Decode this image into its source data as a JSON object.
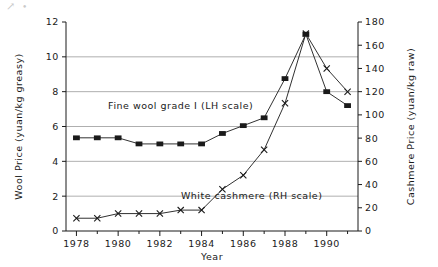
{
  "figure": {
    "background": "#ffffff",
    "ink_color": "#1a1a1a",
    "grid_color": "#9a9a9a",
    "scan_artifact": "↗"
  },
  "chart_data": {
    "type": "line",
    "title": "",
    "subtitle": "",
    "xlabel": "Year",
    "ylabel": "Wool Price (yuan/kg greasy)",
    "y2label": "Cashmere Price (yuan/kg raw)",
    "grid": true,
    "legend_position": "inline-annotation",
    "x": [
      1978,
      1979,
      1980,
      1981,
      1982,
      1983,
      1984,
      1985,
      1986,
      1987,
      1988,
      1989,
      1990,
      1991
    ],
    "xlim": [
      1977.5,
      1991.5
    ],
    "xticks": [
      1978,
      1980,
      1982,
      1984,
      1986,
      1988,
      1990
    ],
    "xticklabels": [
      "1978",
      "1980",
      "1982",
      "1984",
      "1986",
      "1988",
      "1990"
    ],
    "xminorticks": [
      1979,
      1981,
      1983,
      1985,
      1987,
      1989,
      1991
    ],
    "ylim": [
      0,
      12
    ],
    "yticks": [
      0,
      2,
      4,
      6,
      8,
      10,
      12
    ],
    "yticklabels": [
      "0",
      "2",
      "4",
      "6",
      "8",
      "10",
      "12"
    ],
    "y2lim": [
      0,
      180
    ],
    "y2ticks": [
      0,
      20,
      40,
      60,
      80,
      100,
      120,
      140,
      160,
      180
    ],
    "y2ticklabels": [
      "0",
      "20",
      "40",
      "60",
      "80",
      "100",
      "120",
      "140",
      "160",
      "180"
    ],
    "gridlines_y": [
      2,
      4,
      6,
      8,
      10
    ],
    "series": [
      {
        "name": "Fine wool grade I (LH scale)",
        "axis": "left",
        "marker": "filled-square",
        "values": [
          5.35,
          5.35,
          5.35,
          5.0,
          5.0,
          5.0,
          5.0,
          5.6,
          6.05,
          6.5,
          8.75,
          11.3,
          8.0,
          7.2
        ]
      },
      {
        "name": "White cashmere (RH scale)",
        "axis": "right",
        "marker": "cross-x",
        "values": [
          11,
          11,
          15,
          15,
          15,
          18,
          18,
          36,
          48,
          70,
          110,
          170,
          140,
          120
        ]
      }
    ],
    "annotations": [
      {
        "text": "Fine wool grade I (LH scale)",
        "x": 1983.0,
        "y": 7.0,
        "axis": "left"
      },
      {
        "text": "White cashmere (RH scale)",
        "x": 1986.4,
        "y": 1.85,
        "axis": "left"
      }
    ]
  }
}
